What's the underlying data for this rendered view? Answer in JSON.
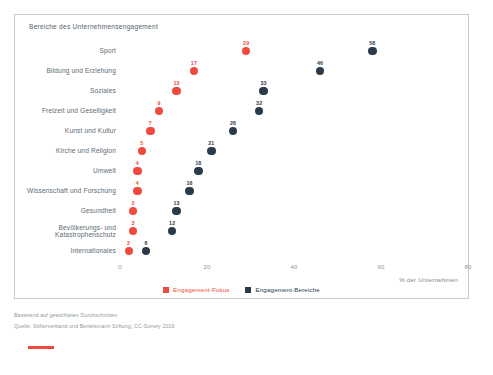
{
  "chart_data": {
    "type": "scatter",
    "subtype": "dot-plot",
    "title": "Bereiche des Unternehmensengagement",
    "xlabel": "% der Unternehmen",
    "ylabel": "",
    "xlim": [
      0,
      80
    ],
    "xticks": [
      0,
      20,
      40,
      60,
      80
    ],
    "xtick_labels": [
      "0",
      "20",
      "40",
      "60",
      "80"
    ],
    "grid": false,
    "legend_position": "bottom",
    "categories": [
      "Sport",
      "Bildung und Erziehung",
      "Soziales",
      "Freizeit und Geselligkeit",
      "Kunst und Kultur",
      "Kirche und Religion",
      "Umwelt",
      "Wissenschaft und Forschung",
      "Gesundheit",
      "Bevölkerungs- und Katastrophenschutz",
      "Internationales"
    ],
    "series": [
      {
        "name": "Engagement-Fokus",
        "color": "#f0493e",
        "values": [
          29,
          17,
          13,
          9,
          7,
          5,
          4,
          4,
          3,
          3,
          2
        ]
      },
      {
        "name": "Engagement-Bereiche",
        "color": "#2b3a4a",
        "values": [
          58,
          46,
          33,
          32,
          26,
          21,
          18,
          16,
          13,
          12,
          6
        ]
      }
    ]
  },
  "legend": [
    {
      "label": "Engagement-Fokus",
      "color": "#f0493e"
    },
    {
      "label": "Engagement-Bereiche",
      "color": "#2b3a4a"
    }
  ],
  "footnotes": {
    "line1": "Basierend auf gewichteten Durchschnitten",
    "line2": "Quelle: Stifterverband und Bertelsmann Stiftung, CC-Survey 2019"
  },
  "colors": {
    "focus": "#f0493e",
    "bereiche": "#2b3a4a",
    "border": "#c9c9c9",
    "text": "#5d6a74"
  }
}
